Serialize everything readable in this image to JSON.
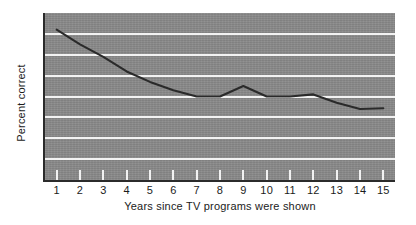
{
  "chart_data": {
    "type": "line",
    "title": "",
    "xlabel": "Years since TV programs were shown",
    "ylabel": "Percent correct",
    "x": [
      1,
      2,
      3,
      4,
      5,
      6,
      7,
      8,
      9,
      10,
      11,
      12,
      13,
      14,
      15
    ],
    "values": [
      76,
      72.5,
      69.5,
      66,
      63.5,
      61.5,
      60,
      60,
      62.5,
      60,
      60,
      60.5,
      58.5,
      57,
      57.2
    ],
    "series": [
      {
        "name": "Percent correct",
        "values": [
          76,
          72.5,
          69.5,
          66,
          63.5,
          61.5,
          60,
          60,
          62.5,
          60,
          60,
          60.5,
          58.5,
          57,
          57.2
        ]
      }
    ],
    "xlim": [
      0.5,
      15.5
    ],
    "ylim": [
      40,
      80
    ],
    "xticks": [
      "1",
      "2",
      "3",
      "4",
      "5",
      "6",
      "7",
      "8",
      "9",
      "10",
      "11",
      "12",
      "13",
      "14",
      "15"
    ],
    "yticks": [
      "40",
      "50",
      "60",
      "70",
      "80"
    ],
    "ytick_values": [
      40,
      50,
      60,
      70,
      80
    ],
    "gridlines": [
      45,
      50,
      55,
      60,
      65,
      70,
      75
    ],
    "grid": true,
    "legend": "none",
    "plot_background_color": "#8a8a8a",
    "gridline_color": "#f2f2f2",
    "line_color": "#2a2a2a",
    "axis_color": "#2b2b2b"
  }
}
